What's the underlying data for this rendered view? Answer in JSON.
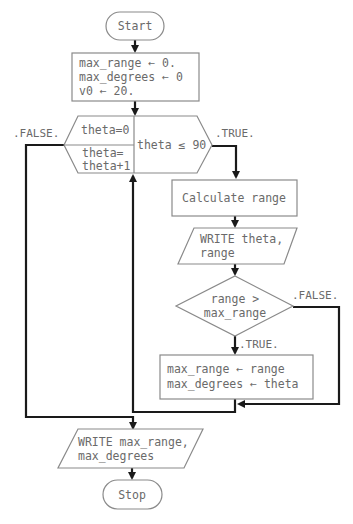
{
  "diagram": {
    "type": "flowchart",
    "nodes": {
      "start": {
        "kind": "terminator",
        "text": "Start"
      },
      "init": {
        "kind": "process",
        "lines": [
          "max_range ← 0.",
          "max_degrees ← 0",
          "v0 ← 20."
        ]
      },
      "loop": {
        "kind": "loop-hexagon",
        "init_text": "theta=0",
        "increment_lines": [
          "theta=",
          "theta+1"
        ],
        "condition": "theta ≤ 90"
      },
      "calc": {
        "kind": "process",
        "text": "Calculate range"
      },
      "write1": {
        "kind": "io",
        "lines": [
          "WRITE theta,",
          "range"
        ]
      },
      "decision": {
        "kind": "decision",
        "lines": [
          "range >",
          "max_range"
        ]
      },
      "assign": {
        "kind": "process",
        "lines": [
          "max_range ← range",
          "max_degrees ← theta"
        ]
      },
      "write2": {
        "kind": "io",
        "lines": [
          "WRITE max_range,",
          "max_degrees"
        ]
      },
      "stop": {
        "kind": "terminator",
        "text": "Stop"
      }
    },
    "edge_labels": {
      "loop_false": ".FALSE.",
      "loop_true": ".TRUE.",
      "decision_false": ".FALSE.",
      "decision_true": ".TRUE."
    },
    "edges": [
      {
        "from": "start",
        "to": "init"
      },
      {
        "from": "init",
        "to": "loop"
      },
      {
        "from": "loop",
        "to": "calc",
        "label": ".TRUE."
      },
      {
        "from": "loop",
        "to": "write2",
        "label": ".FALSE."
      },
      {
        "from": "calc",
        "to": "write1"
      },
      {
        "from": "write1",
        "to": "decision"
      },
      {
        "from": "decision",
        "to": "assign",
        "label": ".TRUE."
      },
      {
        "from": "decision",
        "to": "merge",
        "label": ".FALSE."
      },
      {
        "from": "assign",
        "to": "loop"
      },
      {
        "from": "write2",
        "to": "stop"
      }
    ]
  }
}
